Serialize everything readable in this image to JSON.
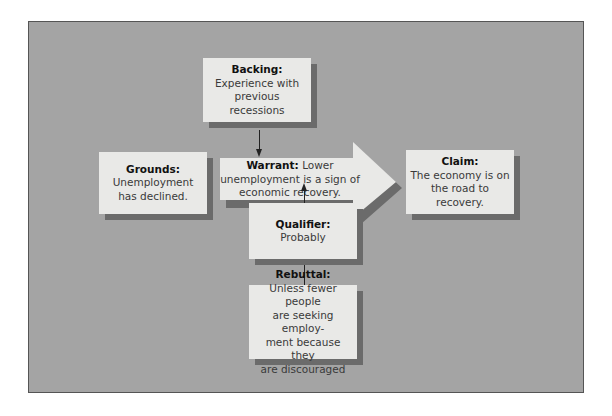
{
  "diagram": {
    "type": "Toulmin model of argument",
    "colors": {
      "background": "#a4a4a4",
      "box": "#e9e9e7",
      "shadow": "#6b6b6b",
      "connector": "#222222"
    },
    "backing": {
      "title": "Backing:",
      "body": "Experience with\nprevious recessions"
    },
    "grounds": {
      "title": "Grounds:",
      "body": "Unemployment\nhas declined."
    },
    "warrant": {
      "title": "Warrant:",
      "body": "Lower unemployment is a sign of economic recovery."
    },
    "claim": {
      "title": "Claim:",
      "body": "The economy is on\nthe road to recovery."
    },
    "qualifier": {
      "title": "Qualifier:",
      "body": "Probably"
    },
    "rebuttal": {
      "title": "Rebuttal:",
      "body": "Unless fewer people\nare seeking employ-\nment because they\nare discouraged"
    },
    "edges": [
      {
        "from": "backing",
        "to": "warrant",
        "style": "arrow"
      },
      {
        "from": "grounds",
        "to": "claim",
        "via": "warrant",
        "style": "block-arrow"
      },
      {
        "from": "qualifier",
        "to": "warrant",
        "style": "arrow"
      },
      {
        "from": "rebuttal",
        "to": "qualifier",
        "style": "line"
      }
    ]
  }
}
